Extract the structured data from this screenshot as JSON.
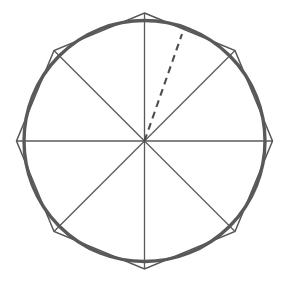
{
  "figure": {
    "canvas": {
      "width": 287,
      "height": 285,
      "background": "#ffffff"
    },
    "center": {
      "x": 144.5,
      "y": 141
    },
    "circle": {
      "name": "circle",
      "radius": 120.5,
      "stroke_color": "#595959",
      "stroke_width": 3.4
    },
    "polygon": {
      "name": "octagon",
      "sides": 8,
      "circumradius": 128,
      "rotation_degrees": 0,
      "stroke_color": "#555555",
      "stroke_width": 1.5,
      "vertices": [
        {
          "label": "top",
          "x": 144.5,
          "y": 13
        },
        {
          "label": "upper-right",
          "x": 235,
          "y": 50.5
        },
        {
          "label": "right",
          "x": 272.5,
          "y": 141
        },
        {
          "label": "lower-right",
          "x": 235,
          "y": 231.5
        },
        {
          "label": "bottom",
          "x": 144.5,
          "y": 269
        },
        {
          "label": "lower-left",
          "x": 54,
          "y": 231.5
        },
        {
          "label": "left",
          "x": 16.5,
          "y": 141
        },
        {
          "label": "upper-left",
          "x": 54,
          "y": 50.5
        }
      ]
    },
    "spokes": {
      "name": "radii",
      "count": 8,
      "stroke_color": "#5a5a5a",
      "stroke_width": 1.3,
      "angles_degrees": [
        0,
        45,
        90,
        135,
        180,
        225,
        270,
        315
      ]
    },
    "dashed_radius": {
      "name": "dashed-radius",
      "stroke_color": "#4d4d4d",
      "stroke_width": 2.1,
      "dash_length": 7,
      "gap_length": 5,
      "angle_degrees": 67,
      "end_point": {
        "x": 182,
        "y": 34
      }
    }
  }
}
